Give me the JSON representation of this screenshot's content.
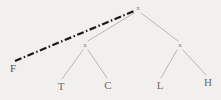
{
  "figure": {
    "background_color": "#f2f0ee",
    "width": 221,
    "height": 100
  },
  "style": {
    "edge_color": "#a9a7a5",
    "edge_width": 0.8,
    "highlight_color": "#1a1a1a",
    "highlight_width": 2.2,
    "highlight_dash": "7,2.5,1.5,2.5",
    "label_color": "#6e6c6b"
  },
  "chart_data": {
    "type": "diagram",
    "subtype": "tree",
    "title": "",
    "nodes": [
      {
        "id": "root",
        "label": "x",
        "x": 138,
        "y": 8,
        "kind": "internal"
      },
      {
        "id": "left",
        "label": "x",
        "x": 85,
        "y": 45,
        "kind": "internal"
      },
      {
        "id": "right",
        "label": "x",
        "x": 180,
        "y": 45,
        "kind": "internal"
      },
      {
        "id": "t",
        "label": "T",
        "x": 61,
        "y": 86,
        "kind": "leaf"
      },
      {
        "id": "c",
        "label": "C",
        "x": 108,
        "y": 85,
        "kind": "leaf"
      },
      {
        "id": "l",
        "label": "L",
        "x": 160,
        "y": 85,
        "kind": "leaf"
      },
      {
        "id": "h",
        "label": "H",
        "x": 208,
        "y": 82,
        "kind": "leaf"
      },
      {
        "id": "f",
        "label": "F",
        "x": 13,
        "y": 68,
        "kind": "anchor"
      }
    ],
    "edges": [
      {
        "from": "root",
        "to": "left",
        "style": "solid",
        "x1": 134,
        "y1": 13,
        "x2": 88,
        "y2": 41
      },
      {
        "from": "root",
        "to": "right",
        "style": "solid",
        "x1": 141,
        "y1": 13,
        "x2": 178,
        "y2": 41
      },
      {
        "from": "left",
        "to": "t",
        "style": "solid",
        "x1": 83,
        "y1": 50,
        "x2": 62,
        "y2": 79
      },
      {
        "from": "left",
        "to": "c",
        "style": "solid",
        "x1": 88,
        "y1": 50,
        "x2": 107,
        "y2": 78
      },
      {
        "from": "right",
        "to": "l",
        "style": "solid",
        "x1": 177,
        "y1": 50,
        "x2": 161,
        "y2": 78
      },
      {
        "from": "right",
        "to": "h",
        "style": "solid",
        "x1": 183,
        "y1": 50,
        "x2": 206,
        "y2": 75
      },
      {
        "from": "f",
        "to": "root",
        "style": "dash-dot",
        "x1": 15,
        "y1": 61,
        "x2": 134,
        "y2": 11
      }
    ],
    "legend": [],
    "annotations": []
  }
}
